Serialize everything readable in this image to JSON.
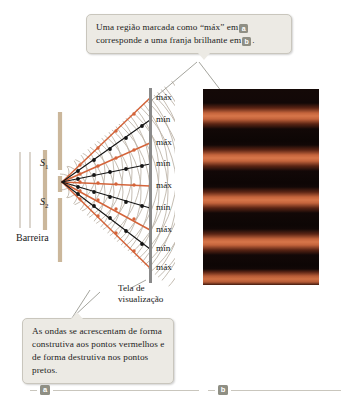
{
  "figure": {
    "title_absent": true,
    "callout_top": {
      "text_part1": "Uma região marcada como  “máx” em",
      "chip1": "a",
      "text_part2": "corresponde a uma franja brilhante em",
      "chip2": "b",
      "text_part3": "."
    },
    "callout_bottom": {
      "text": "As ondas se acrescentam de forma construtiva aos pontos vermelhos e de forma destrutiva nos pontos pretos."
    },
    "labels": {
      "barrier": "Barreira",
      "screen": "Tela de visualização",
      "screen_line1": "Tela de",
      "screen_line2": "visualização",
      "slit1": "S",
      "slit1_sub": "1",
      "slit2": "S",
      "slit2_sub": "2"
    },
    "screen_markers": [
      {
        "label": "máx",
        "type": "maximum",
        "y": 98
      },
      {
        "label": "mín",
        "type": "minimum",
        "y": 120
      },
      {
        "label": "máx",
        "type": "maximum",
        "y": 143
      },
      {
        "label": "mín",
        "type": "minimum",
        "y": 164
      },
      {
        "label": "máx",
        "type": "maximum",
        "y": 186
      },
      {
        "label": "mín",
        "type": "minimum",
        "y": 208
      },
      {
        "label": "máx",
        "type": "maximum",
        "y": 230
      },
      {
        "label": "mín",
        "type": "minimum",
        "y": 249
      },
      {
        "label": "máx",
        "type": "maximum",
        "y": 268
      }
    ],
    "part_markers": [
      {
        "id": "a",
        "label": "a"
      },
      {
        "id": "b",
        "label": "b"
      }
    ],
    "photo": {
      "description": "Fotografia do padrão de franjas de interferência",
      "bright_fringes": 5
    },
    "colors": {
      "constructive": "#d4643a",
      "destructive": "#1a1a1a",
      "wavefront": "#b7ada0",
      "barrier": "#cbb79b",
      "screen": "#8a8a8a",
      "callout_bg": "#eceae4",
      "callout_border": "#c9c6bd",
      "chip_bg": "#8f8f84",
      "fringe_bright": "#d7764a",
      "fringe_dark": "#120807"
    }
  }
}
